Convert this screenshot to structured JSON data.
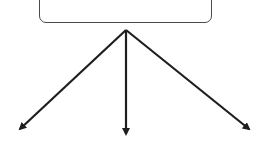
{
  "diagram": {
    "root_node": {
      "label": "",
      "label_visible": false,
      "note": "label text cropped off top edge"
    },
    "edges": [
      {
        "id": "left",
        "from": [
          126,
          30
        ],
        "to": [
          16,
          133
        ]
      },
      {
        "id": "center",
        "from": [
          126,
          30
        ],
        "to": [
          126,
          140
        ]
      },
      {
        "id": "right",
        "from": [
          126,
          30
        ],
        "to": [
          253,
          132
        ]
      }
    ],
    "colors": {
      "stroke": "#1e1e1e",
      "box_border": "#4a4a4a",
      "background": "#ffffff"
    }
  }
}
